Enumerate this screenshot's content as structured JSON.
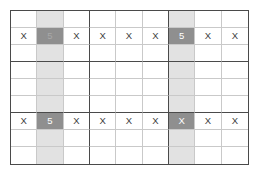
{
  "figure": {
    "kind": "sudoku-grid",
    "size": 9,
    "block_size": 3,
    "colors": {
      "background": "#ffffff",
      "grid_outer_border": "#4a4a4a",
      "grid_thin_line": "#c9c9c9",
      "grid_block_line": "#4a4a4a",
      "column_highlight": "#e2e2e2",
      "intersection_highlight": "#8f8f8f",
      "mark_text": "#3d3d3d",
      "highlight_text": "#ffffff"
    },
    "highlighted_columns": [
      2,
      7
    ],
    "marked_rows": [
      2,
      7
    ]
  },
  "cells": [
    [
      {
        "text": "",
        "hl": "none"
      },
      {
        "text": "",
        "hl": "col"
      },
      {
        "text": "",
        "hl": "none"
      },
      {
        "text": "",
        "hl": "none"
      },
      {
        "text": "",
        "hl": "none"
      },
      {
        "text": "",
        "hl": "none"
      },
      {
        "text": "",
        "hl": "col"
      },
      {
        "text": "",
        "hl": "none"
      },
      {
        "text": "",
        "hl": "none"
      }
    ],
    [
      {
        "text": "X",
        "hl": "none"
      },
      {
        "text": "5",
        "hl": "cross",
        "faint": true
      },
      {
        "text": "X",
        "hl": "none"
      },
      {
        "text": "X",
        "hl": "none"
      },
      {
        "text": "X",
        "hl": "none"
      },
      {
        "text": "X",
        "hl": "none"
      },
      {
        "text": "5",
        "hl": "cross"
      },
      {
        "text": "X",
        "hl": "none"
      },
      {
        "text": "X",
        "hl": "none"
      }
    ],
    [
      {
        "text": "",
        "hl": "none"
      },
      {
        "text": "",
        "hl": "col"
      },
      {
        "text": "",
        "hl": "none"
      },
      {
        "text": "",
        "hl": "none"
      },
      {
        "text": "",
        "hl": "none"
      },
      {
        "text": "",
        "hl": "none"
      },
      {
        "text": "",
        "hl": "col"
      },
      {
        "text": "",
        "hl": "none"
      },
      {
        "text": "",
        "hl": "none"
      }
    ],
    [
      {
        "text": "",
        "hl": "none"
      },
      {
        "text": "",
        "hl": "col"
      },
      {
        "text": "",
        "hl": "none"
      },
      {
        "text": "",
        "hl": "none"
      },
      {
        "text": "",
        "hl": "none"
      },
      {
        "text": "",
        "hl": "none"
      },
      {
        "text": "",
        "hl": "col"
      },
      {
        "text": "",
        "hl": "none"
      },
      {
        "text": "",
        "hl": "none"
      }
    ],
    [
      {
        "text": "",
        "hl": "none"
      },
      {
        "text": "",
        "hl": "col"
      },
      {
        "text": "",
        "hl": "none"
      },
      {
        "text": "",
        "hl": "none"
      },
      {
        "text": "",
        "hl": "none"
      },
      {
        "text": "",
        "hl": "none"
      },
      {
        "text": "",
        "hl": "col"
      },
      {
        "text": "",
        "hl": "none"
      },
      {
        "text": "",
        "hl": "none"
      }
    ],
    [
      {
        "text": "",
        "hl": "none"
      },
      {
        "text": "",
        "hl": "col"
      },
      {
        "text": "",
        "hl": "none"
      },
      {
        "text": "",
        "hl": "none"
      },
      {
        "text": "",
        "hl": "none"
      },
      {
        "text": "",
        "hl": "none"
      },
      {
        "text": "",
        "hl": "col"
      },
      {
        "text": "",
        "hl": "none"
      },
      {
        "text": "",
        "hl": "none"
      }
    ],
    [
      {
        "text": "X",
        "hl": "none"
      },
      {
        "text": "5",
        "hl": "cross"
      },
      {
        "text": "X",
        "hl": "none"
      },
      {
        "text": "X",
        "hl": "none"
      },
      {
        "text": "X",
        "hl": "none"
      },
      {
        "text": "X",
        "hl": "none"
      },
      {
        "text": "X",
        "hl": "cross"
      },
      {
        "text": "X",
        "hl": "none"
      },
      {
        "text": "X",
        "hl": "none"
      }
    ],
    [
      {
        "text": "",
        "hl": "none"
      },
      {
        "text": "",
        "hl": "col"
      },
      {
        "text": "",
        "hl": "none"
      },
      {
        "text": "",
        "hl": "none"
      },
      {
        "text": "",
        "hl": "none"
      },
      {
        "text": "",
        "hl": "none"
      },
      {
        "text": "",
        "hl": "col"
      },
      {
        "text": "",
        "hl": "none"
      },
      {
        "text": "",
        "hl": "none"
      }
    ],
    [
      {
        "text": "",
        "hl": "none"
      },
      {
        "text": "",
        "hl": "col"
      },
      {
        "text": "",
        "hl": "none"
      },
      {
        "text": "",
        "hl": "none"
      },
      {
        "text": "",
        "hl": "none"
      },
      {
        "text": "",
        "hl": "none"
      },
      {
        "text": "",
        "hl": "col"
      },
      {
        "text": "",
        "hl": "none"
      },
      {
        "text": "",
        "hl": "none"
      }
    ]
  ]
}
